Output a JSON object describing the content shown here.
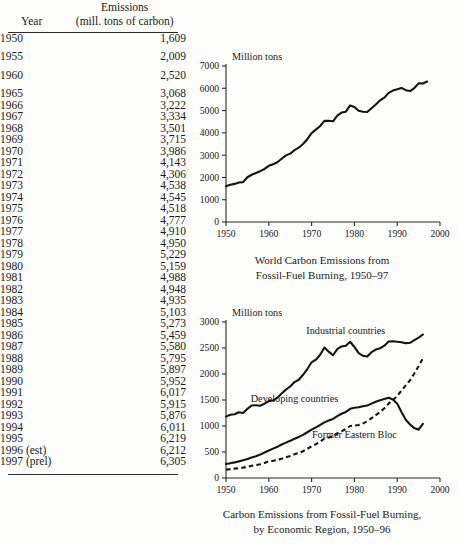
{
  "table": {
    "header": {
      "col1": "Year",
      "col2_line1": "Emissions",
      "col2_line2": "(mill. tons of carbon)"
    },
    "rows": [
      {
        "year": "1950",
        "value": "1,609",
        "gap_after": true
      },
      {
        "year": "1955",
        "value": "2,009",
        "gap_after": true
      },
      {
        "year": "1960",
        "value": "2,520",
        "gap_after": true
      },
      {
        "year": "1965",
        "value": "3,068",
        "gap_after": false
      },
      {
        "year": "1966",
        "value": "3,222",
        "gap_after": false
      },
      {
        "year": "1967",
        "value": "3,334",
        "gap_after": false
      },
      {
        "year": "1968",
        "value": "3,501",
        "gap_after": false
      },
      {
        "year": "1969",
        "value": "3,715",
        "gap_after": false
      },
      {
        "year": "1970",
        "value": "3,986",
        "gap_after": false
      },
      {
        "year": "1971",
        "value": "4,143",
        "gap_after": false
      },
      {
        "year": "1972",
        "value": "4,306",
        "gap_after": false
      },
      {
        "year": "1973",
        "value": "4,538",
        "gap_after": false
      },
      {
        "year": "1974",
        "value": "4,545",
        "gap_after": false
      },
      {
        "year": "1975",
        "value": "4,518",
        "gap_after": false
      },
      {
        "year": "1976",
        "value": "4,777",
        "gap_after": false
      },
      {
        "year": "1977",
        "value": "4,910",
        "gap_after": false
      },
      {
        "year": "1978",
        "value": "4,950",
        "gap_after": false
      },
      {
        "year": "1979",
        "value": "5,229",
        "gap_after": false
      },
      {
        "year": "1980",
        "value": "5,159",
        "gap_after": false
      },
      {
        "year": "1981",
        "value": "4,988",
        "gap_after": false
      },
      {
        "year": "1982",
        "value": "4,948",
        "gap_after": false
      },
      {
        "year": "1983",
        "value": "4,935",
        "gap_after": false
      },
      {
        "year": "1984",
        "value": "5,103",
        "gap_after": false
      },
      {
        "year": "1985",
        "value": "5,273",
        "gap_after": false
      },
      {
        "year": "1986",
        "value": "5,459",
        "gap_after": false
      },
      {
        "year": "1987",
        "value": "5,580",
        "gap_after": false
      },
      {
        "year": "1988",
        "value": "5,795",
        "gap_after": false
      },
      {
        "year": "1989",
        "value": "5,897",
        "gap_after": false
      },
      {
        "year": "1990",
        "value": "5,952",
        "gap_after": false
      },
      {
        "year": "1991",
        "value": "6,017",
        "gap_after": false
      },
      {
        "year": "1992",
        "value": "5,915",
        "gap_after": false
      },
      {
        "year": "1993",
        "value": "5,876",
        "gap_after": false
      },
      {
        "year": "1994",
        "value": "6,011",
        "gap_after": false
      },
      {
        "year": "1995",
        "value": "6,219",
        "gap_after": false
      },
      {
        "year": "1996 (est)",
        "value": "6,212",
        "gap_after": false
      },
      {
        "year": "1997 (prel)",
        "value": "6,305",
        "gap_after": false
      }
    ]
  },
  "chart_data": [
    {
      "id": "world-emissions",
      "type": "line",
      "title": "World Carbon Emissions from\nFossil-Fuel Burning, 1950–97",
      "caption_line1": "World Carbon Emissions from",
      "caption_line2": "Fossil-Fuel Burning, 1950–97",
      "ylabel": "Million tons",
      "xlabel": "",
      "xlim": [
        1950,
        2000
      ],
      "ylim": [
        0,
        7000
      ],
      "xticks": [
        1950,
        1960,
        1970,
        1980,
        1990,
        2000
      ],
      "yticks": [
        0,
        1000,
        2000,
        3000,
        4000,
        5000,
        6000,
        7000
      ],
      "grid": false,
      "legend": "none",
      "x": [
        1950,
        1951,
        1952,
        1953,
        1954,
        1955,
        1956,
        1957,
        1958,
        1959,
        1960,
        1961,
        1962,
        1963,
        1964,
        1965,
        1966,
        1967,
        1968,
        1969,
        1970,
        1971,
        1972,
        1973,
        1974,
        1975,
        1976,
        1977,
        1978,
        1979,
        1980,
        1981,
        1982,
        1983,
        1984,
        1985,
        1986,
        1987,
        1988,
        1989,
        1990,
        1991,
        1992,
        1993,
        1994,
        1995,
        1996,
        1997
      ],
      "values": [
        1609,
        1670,
        1710,
        1770,
        1790,
        2009,
        2120,
        2200,
        2280,
        2380,
        2520,
        2590,
        2680,
        2840,
        2990,
        3068,
        3222,
        3334,
        3501,
        3715,
        3986,
        4143,
        4306,
        4538,
        4545,
        4518,
        4777,
        4910,
        4950,
        5229,
        5159,
        4988,
        4948,
        4935,
        5103,
        5273,
        5459,
        5580,
        5795,
        5897,
        5952,
        6017,
        5915,
        5876,
        6011,
        6219,
        6212,
        6305
      ]
    },
    {
      "id": "emissions-by-region",
      "type": "line",
      "title": "Carbon Emissions from Fossil-Fuel Burning,\nby Economic Region, 1950–96",
      "caption_line1": "Carbon Emissions from Fossil-Fuel Burning,",
      "caption_line2": "by Economic Region, 1950–96",
      "ylabel": "Million tons",
      "xlabel": "",
      "xlim": [
        1950,
        2000
      ],
      "ylim": [
        0,
        3000
      ],
      "xticks": [
        1950,
        1960,
        1970,
        1980,
        1990,
        2000
      ],
      "yticks": [
        0,
        500,
        1000,
        1500,
        2000,
        2500,
        3000
      ],
      "grid": false,
      "legend": "inline-annotations",
      "x": [
        1950,
        1951,
        1952,
        1953,
        1954,
        1955,
        1956,
        1957,
        1958,
        1959,
        1960,
        1961,
        1962,
        1963,
        1964,
        1965,
        1966,
        1967,
        1968,
        1969,
        1970,
        1971,
        1972,
        1973,
        1974,
        1975,
        1976,
        1977,
        1978,
        1979,
        1980,
        1981,
        1982,
        1983,
        1984,
        1985,
        1986,
        1987,
        1988,
        1989,
        1990,
        1991,
        1992,
        1993,
        1994,
        1995,
        1996
      ],
      "series": [
        {
          "name": "Industrial countries",
          "style": "solid",
          "label_x": 1978,
          "label_y": 2760,
          "values": [
            1180,
            1215,
            1225,
            1265,
            1250,
            1330,
            1395,
            1400,
            1390,
            1430,
            1480,
            1490,
            1545,
            1625,
            1700,
            1760,
            1845,
            1890,
            1985,
            2095,
            2225,
            2275,
            2370,
            2510,
            2430,
            2360,
            2480,
            2530,
            2545,
            2620,
            2520,
            2400,
            2350,
            2335,
            2420,
            2470,
            2495,
            2545,
            2625,
            2630,
            2620,
            2610,
            2590,
            2600,
            2650,
            2700,
            2760
          ]
        },
        {
          "name": "Developing countries",
          "style": "dashed",
          "label_x": 1966,
          "label_y": 1460,
          "values": [
            160,
            170,
            180,
            190,
            200,
            215,
            235,
            250,
            265,
            290,
            320,
            330,
            345,
            370,
            400,
            425,
            455,
            480,
            515,
            560,
            610,
            650,
            700,
            760,
            780,
            800,
            860,
            900,
            940,
            1000,
            1010,
            1020,
            1050,
            1090,
            1150,
            1210,
            1270,
            1340,
            1430,
            1500,
            1580,
            1680,
            1780,
            1880,
            2010,
            2150,
            2300
          ]
        },
        {
          "name": "Former Eastern Bloc",
          "style": "solid",
          "label_x": 1980,
          "label_y": 760,
          "values": [
            270,
            285,
            300,
            320,
            340,
            365,
            395,
            420,
            450,
            490,
            530,
            565,
            600,
            645,
            680,
            715,
            755,
            790,
            830,
            880,
            930,
            975,
            1020,
            1070,
            1105,
            1135,
            1190,
            1235,
            1270,
            1330,
            1350,
            1360,
            1380,
            1395,
            1430,
            1465,
            1495,
            1520,
            1545,
            1510,
            1430,
            1270,
            1120,
            1030,
            960,
            930,
            1040
          ]
        }
      ]
    }
  ]
}
